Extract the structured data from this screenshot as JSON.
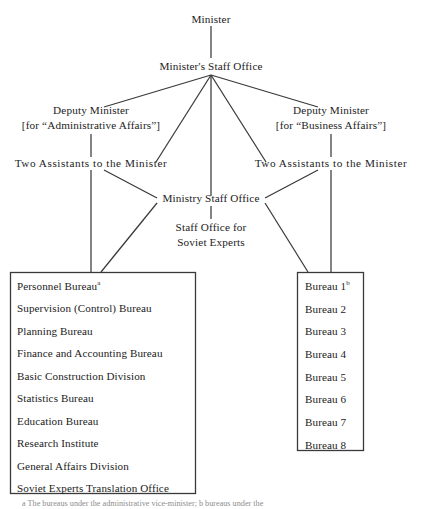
{
  "figure": {
    "type": "organization-chart",
    "title_node": "Minister"
  },
  "nodes": {
    "minister": "Minister",
    "minister_staff_office": "Minister's Staff Office",
    "deputy_minister_left": "Deputy Minister",
    "deputy_minister_left_sub": "[for “Administrative Affairs”]",
    "deputy_minister_right": "Deputy Minister",
    "deputy_minister_right_sub": "[for “Business Affairs”]",
    "assistants_left": "Two Assistants to the Minister",
    "assistants_right": "Two Assistants to the Minister",
    "ministry_staff_office": "Ministry Staff Office",
    "soviet_experts_office_line1": "Staff Office for",
    "soviet_experts_office_line2": "Soviet Experts"
  },
  "left_box": {
    "items": [
      "Personnel Bureau",
      "Supervision (Control) Bureau",
      "Planning Bureau",
      "Finance and Accounting Bureau",
      "Basic Construction Division",
      "Statistics Bureau",
      "Education Bureau",
      "Research Institute",
      "General Affairs Division",
      "Soviet Experts Translation Office"
    ],
    "footnote_markers": {
      "0": "a"
    }
  },
  "right_box": {
    "items": [
      "Bureau 1",
      "Bureau 2",
      "Bureau 3",
      "Bureau 4",
      "Bureau 5",
      "Bureau 6",
      "Bureau 7",
      "Bureau 8"
    ],
    "footnote_markers": {
      "0": "b"
    }
  },
  "footnote": {
    "text": "a The bureaus under the administrative vice-minister; b bureaus under the"
  },
  "colors": {
    "line": "#3a3a3a",
    "text": "#1c1c1c",
    "background": "#ffffff",
    "footnote": "#8d8d8d"
  }
}
